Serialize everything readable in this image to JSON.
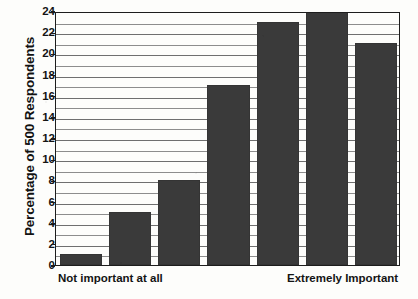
{
  "chart_data": {
    "type": "bar",
    "title": "",
    "xlabel": "",
    "ylabel": "Percentage of 500 Respondents",
    "categories": [
      "1",
      "2",
      "3",
      "4",
      "5",
      "6",
      "7"
    ],
    "values": [
      1,
      5,
      8,
      17,
      23,
      24,
      21
    ],
    "ylim": [
      0,
      24
    ],
    "ytick_values": [
      0,
      2,
      4,
      6,
      8,
      10,
      12,
      14,
      16,
      18,
      20,
      22,
      24
    ],
    "ytick_labels": [
      "0",
      "2",
      "4",
      "6",
      "8",
      "10",
      "12",
      "14",
      "16",
      "18",
      "20",
      "22",
      "24"
    ],
    "minor_gridline_values": [
      1,
      3,
      5,
      7,
      9,
      11,
      13,
      15,
      17,
      19,
      21,
      23
    ],
    "grid": true,
    "legend": "none",
    "bar_color": "#3a3a3a",
    "grid_color": "#8d8d8d",
    "axis_color": "#1d1d1d",
    "background_color": "#fdfdfb",
    "x_endpoint_labels": {
      "left": "Not important at all",
      "right": "Extremely Important"
    }
  }
}
